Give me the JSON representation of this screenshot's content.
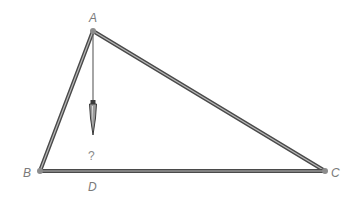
{
  "diagram": {
    "type": "geometry-triangle-with-plumb-line",
    "colors": {
      "edge_outer": "#4a4a4a",
      "edge_inner": "#b8b8b8",
      "vertex_dot": "#8c8c8c",
      "label": "#7a7a7a",
      "plumb_line": "#6a6a6a"
    },
    "vertices": {
      "A": {
        "label": "A",
        "x": 93,
        "y": 31
      },
      "B": {
        "label": "B",
        "x": 40,
        "y": 171
      },
      "C": {
        "label": "C",
        "x": 325,
        "y": 171
      }
    },
    "foot_point": {
      "label": "D",
      "x": 93,
      "y": 186
    },
    "unknown_marker": {
      "label": "?",
      "x": 92,
      "y": 158
    },
    "plumb_bob": {
      "top_y": 100,
      "tip_y": 135,
      "x": 93
    },
    "edges": [
      {
        "from": "A",
        "to": "B"
      },
      {
        "from": "A",
        "to": "C"
      },
      {
        "from": "B",
        "to": "C"
      }
    ]
  }
}
